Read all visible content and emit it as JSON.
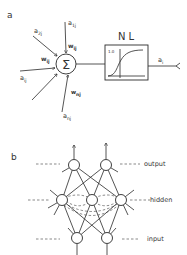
{
  "panel_a": {
    "label": "a",
    "sum_symbol": "Σ",
    "nonlinearity": {
      "title": "N L",
      "y_tick": "1.0"
    },
    "inputs": [
      {
        "activation": "a",
        "activation_sub": "2j",
        "weight": "w",
        "weight_sub": ""
      },
      {
        "activation": "a",
        "activation_sub": "1j",
        "weight": "w",
        "weight_sub": "ij"
      },
      {
        "activation": "a",
        "activation_sub": "ij",
        "weight": "w",
        "weight_sub": "ij"
      },
      {
        "activation": "a",
        "activation_sub": "nj",
        "weight": "w",
        "weight_sub": "nj"
      }
    ],
    "output": {
      "activation": "a",
      "activation_sub": "i"
    }
  },
  "panel_b": {
    "label": "b",
    "layers": [
      {
        "name": "output",
        "nodes": 2
      },
      {
        "name": "hidden",
        "nodes": 3
      },
      {
        "name": "input",
        "nodes": 2
      }
    ]
  }
}
